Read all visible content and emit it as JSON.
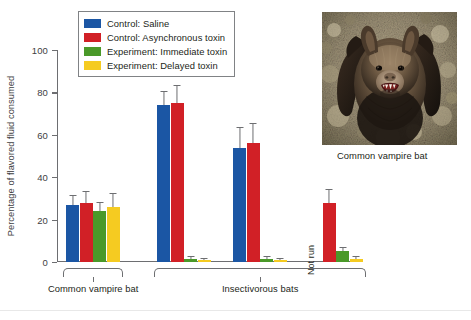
{
  "chart_data": {
    "type": "bar",
    "title": "",
    "xlabel": "",
    "ylabel": "Percentage of flavored fluid consumed",
    "ylim": [
      0,
      100
    ],
    "yticks": [
      0,
      20,
      40,
      60,
      80,
      100
    ],
    "ytick_labels": [
      "0",
      "20",
      "40",
      "60",
      "80",
      "100"
    ],
    "grid": false,
    "legend_position": "top-left-inside",
    "series": [
      {
        "name": "Control: Saline",
        "color": "#1b56a4",
        "values": [
          27,
          74,
          54,
          null
        ],
        "errors": [
          4,
          6,
          9,
          null
        ]
      },
      {
        "name": "Control: Asynchronous toxin",
        "color": "#d12026",
        "values": [
          28,
          75,
          56,
          28
        ],
        "errors": [
          5,
          8,
          9,
          6
        ]
      },
      {
        "name": "Experiment: Immediate toxin",
        "color": "#4a9929",
        "values": [
          24,
          1.5,
          1.5,
          5
        ],
        "errors": [
          4,
          0.8,
          0.8,
          1.5
        ]
      },
      {
        "name": "Experiment: Delayed toxin",
        "color": "#f5cb21",
        "values": [
          26,
          1,
          1,
          1.5
        ],
        "errors": [
          6,
          0.6,
          0.6,
          0.8
        ]
      }
    ],
    "categories": [
      "Group 1",
      "Group 2",
      "Group 3",
      "Group 4"
    ],
    "annotations": [
      {
        "text": "Not run",
        "group": 4,
        "series": "Control: Saline",
        "orientation": "vertical"
      }
    ],
    "group_brackets": [
      {
        "label": "Common vampire bat",
        "groups": [
          1
        ]
      },
      {
        "label": "Insectivorous bats",
        "groups": [
          2,
          3,
          4
        ]
      }
    ]
  },
  "legend": {
    "items": [
      {
        "label": "Control: Saline",
        "color": "#1b56a4"
      },
      {
        "label": "Control: Asynchronous toxin",
        "color": "#d12026"
      },
      {
        "label": "Experiment: Immediate toxin",
        "color": "#4a9929"
      },
      {
        "label": "Experiment: Delayed toxin",
        "color": "#f5cb21"
      }
    ]
  },
  "axis": {
    "y_title": "Percentage of flavored fluid consumed",
    "y_labels": [
      "100",
      "80",
      "60",
      "40",
      "20",
      "0"
    ]
  },
  "brackets": {
    "left_label": "Common vampire bat",
    "right_label": "Insectivorous bats"
  },
  "annotations": {
    "not_run": "Not run"
  },
  "photo": {
    "caption": "Common vampire bat",
    "alt": "common-vampire-bat-photo"
  }
}
